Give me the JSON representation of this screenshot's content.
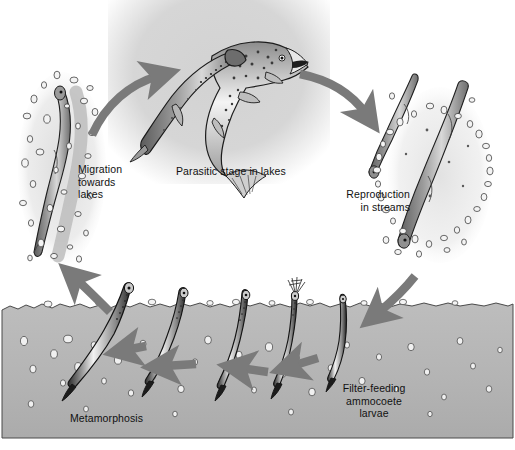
{
  "figure": {
    "kind": "life-cycle-diagram",
    "background_color": "#ffffff",
    "arrow_color": "#7a7a7a",
    "substrate_color": "#b5b5b5",
    "panel_color": "#d6d6d6",
    "text_color": "#111111"
  },
  "labels": {
    "migration": "Migration\ntowards\nlakes",
    "parasitic": "Parasitic stage in lakes",
    "reproduction": "Reproduction\nin streams",
    "filter_feeding": "Filter-feeding\nammocoete\nlarvae",
    "metamorphosis": "Metamorphosis"
  },
  "stages": [
    {
      "id": "migration",
      "label": "Migration towards lakes",
      "position": "left"
    },
    {
      "id": "parasitic",
      "label": "Parasitic stage in lakes",
      "position": "top-center"
    },
    {
      "id": "reproduction",
      "label": "Reproduction in streams",
      "position": "right"
    },
    {
      "id": "filter-feeding",
      "label": "Filter-feeding ammocoete larvae",
      "position": "bottom-right"
    },
    {
      "id": "metamorphosis",
      "label": "Metamorphosis",
      "position": "bottom-left"
    }
  ],
  "arrows": [
    {
      "id": "migration-to-parasitic",
      "from": "migration",
      "to": "parasitic",
      "direction": "up-right"
    },
    {
      "id": "parasitic-to-reproduction",
      "from": "parasitic",
      "to": "reproduction",
      "direction": "down-right"
    },
    {
      "id": "reproduction-to-larvae",
      "from": "reproduction",
      "to": "filter-feeding",
      "direction": "down-left"
    },
    {
      "id": "larvae-chain-1",
      "from": "filter-feeding",
      "to": "filter-feeding",
      "direction": "left"
    },
    {
      "id": "larvae-chain-2",
      "from": "filter-feeding",
      "to": "filter-feeding",
      "direction": "left"
    },
    {
      "id": "larvae-chain-3",
      "from": "filter-feeding",
      "to": "metamorphosis",
      "direction": "left"
    },
    {
      "id": "metamorphosis-to-migration",
      "from": "metamorphosis",
      "to": "migration",
      "direction": "up-left"
    }
  ]
}
